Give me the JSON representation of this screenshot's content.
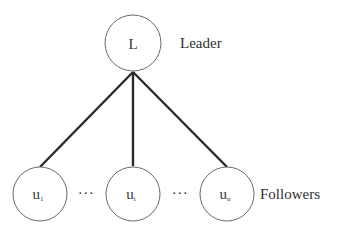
{
  "diagram": {
    "type": "leader-follower-tree",
    "colors": {
      "edge": "#2a2a2a",
      "node_stroke": "#6a6a6a",
      "text": "#2f2f2f",
      "background": "#ffffff"
    },
    "leader": {
      "label": "L",
      "role_label": "Leader"
    },
    "followers": {
      "role_label": "Followers",
      "nodes": [
        {
          "base": "u",
          "subscript": "1"
        },
        {
          "base": "u",
          "subscript": "i"
        },
        {
          "base": "u",
          "subscript": "n"
        }
      ],
      "ellipses": [
        "···",
        "···"
      ]
    },
    "edges": [
      {
        "from": "L",
        "to": "u1"
      },
      {
        "from": "L",
        "to": "ui"
      },
      {
        "from": "L",
        "to": "un"
      }
    ]
  }
}
